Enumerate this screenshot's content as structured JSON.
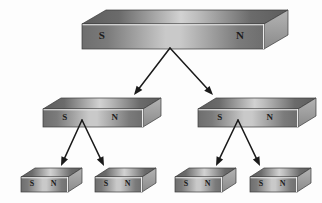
{
  "diagram": {
    "background_color": "#fdfdfd",
    "pole_south": "S",
    "pole_north": "N",
    "magnet_colors": {
      "front_dark": "#6e6e6e",
      "front_light": "#c9c9c9",
      "top_dark": "#5d5d5d",
      "top_light": "#d2d2d2",
      "side_dark": "#8a8a8a",
      "side_light": "#b4b4b4",
      "edge_highlight": "#f2f2f2",
      "outline": "#3a3a3a"
    },
    "arrow_color": "#1a1a1a"
  },
  "levels": [
    {
      "name": "level-1-whole-magnet",
      "magnets": [
        {
          "id": "magnet-whole",
          "x": 81,
          "y": 9,
          "width": 182,
          "height": 25,
          "depth_x": 24,
          "depth_y": 14,
          "font_size": 11,
          "south": "S",
          "north": "N",
          "south_x": 0.11,
          "north_x": 0.87
        }
      ]
    },
    {
      "name": "level-2-halves",
      "magnets": [
        {
          "id": "magnet-half-left",
          "x": 42,
          "y": 97,
          "width": 100,
          "height": 18,
          "depth_x": 18,
          "depth_y": 11,
          "font_size": 9,
          "south": "S",
          "north": "N",
          "south_x": 0.22,
          "north_x": 0.72
        },
        {
          "id": "magnet-half-right",
          "x": 197,
          "y": 97,
          "width": 100,
          "height": 18,
          "depth_x": 18,
          "depth_y": 11,
          "font_size": 9,
          "south": "S",
          "north": "N",
          "south_x": 0.22,
          "north_x": 0.72
        }
      ]
    },
    {
      "name": "level-3-quarters",
      "magnets": [
        {
          "id": "magnet-quarter-1",
          "x": 20,
          "y": 167,
          "width": 47,
          "height": 15,
          "depth_x": 14,
          "depth_y": 9,
          "font_size": 8,
          "south": "S",
          "north": "N",
          "south_x": 0.24,
          "north_x": 0.7
        },
        {
          "id": "magnet-quarter-2",
          "x": 94,
          "y": 167,
          "width": 47,
          "height": 15,
          "depth_x": 14,
          "depth_y": 9,
          "font_size": 8,
          "south": "S",
          "north": "N",
          "south_x": 0.24,
          "north_x": 0.7
        },
        {
          "id": "magnet-quarter-3",
          "x": 174,
          "y": 167,
          "width": 47,
          "height": 15,
          "depth_x": 14,
          "depth_y": 9,
          "font_size": 8,
          "south": "S",
          "north": "N",
          "south_x": 0.24,
          "north_x": 0.7
        },
        {
          "id": "magnet-quarter-4",
          "x": 249,
          "y": 167,
          "width": 47,
          "height": 15,
          "depth_x": 14,
          "depth_y": 9,
          "font_size": 8,
          "south": "S",
          "north": "N",
          "south_x": 0.24,
          "north_x": 0.7
        }
      ]
    }
  ],
  "arrows": [
    {
      "id": "arrow-whole-to-left-half",
      "x1": 170,
      "y1": 48,
      "x2": 134,
      "y2": 95
    },
    {
      "id": "arrow-whole-to-right-half",
      "x1": 170,
      "y1": 48,
      "x2": 213,
      "y2": 95
    },
    {
      "id": "arrow-left-half-to-q1",
      "x1": 82,
      "y1": 120,
      "x2": 61,
      "y2": 166
    },
    {
      "id": "arrow-left-half-to-q2",
      "x1": 82,
      "y1": 120,
      "x2": 104,
      "y2": 166
    },
    {
      "id": "arrow-right-half-to-q3",
      "x1": 238,
      "y1": 120,
      "x2": 216,
      "y2": 166
    },
    {
      "id": "arrow-right-half-to-q4",
      "x1": 238,
      "y1": 120,
      "x2": 260,
      "y2": 166
    }
  ]
}
